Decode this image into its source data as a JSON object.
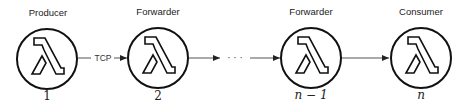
{
  "diagram": {
    "nodes": [
      {
        "role": "Producer",
        "index": "1",
        "italic": false,
        "icon": "lambda-icon"
      },
      {
        "role": "Forwarder",
        "index": "2",
        "italic": false,
        "icon": "lambda-icon"
      },
      {
        "role": "Forwarder",
        "index": "n − 1",
        "italic": true,
        "icon": "lambda-icon"
      },
      {
        "role": "Consumer",
        "index": "n",
        "italic": true,
        "icon": "lambda-icon"
      }
    ],
    "edges": [
      {
        "from": 1,
        "to": 2,
        "label": "TCP"
      },
      {
        "from": 2,
        "to": "ellipsis",
        "label": ""
      },
      {
        "from": "ellipsis",
        "to": 3,
        "label": ""
      },
      {
        "from": 3,
        "to": 4,
        "label": ""
      }
    ],
    "ellipsis": "· · ·",
    "colors": {
      "stroke": "#111111",
      "edge": "#555555"
    }
  }
}
